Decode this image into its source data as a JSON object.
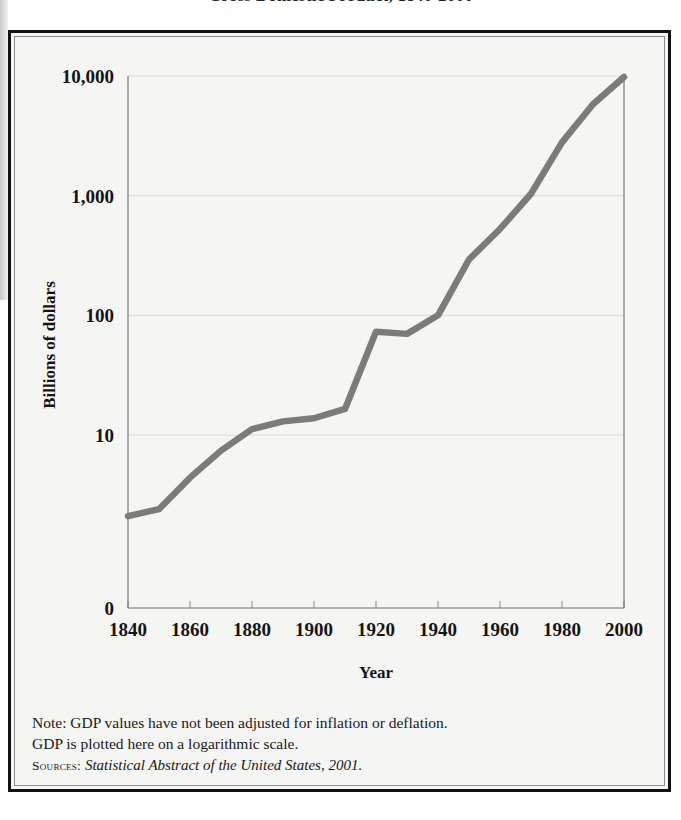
{
  "figure": {
    "title": "Gross Domestic Product, 1840-2000",
    "frame_background": "#f5f5f3",
    "frame_border_color": "#121212"
  },
  "footer": {
    "note_line_1": "Note: GDP values have not been adjusted for inflation or deflation.",
    "note_line_2": "GDP is plotted here on a logarithmic scale.",
    "sources_label": "Sources:",
    "sources_text": "Statistical Abstract of the United States, 2001."
  },
  "chart_data": {
    "type": "line",
    "title": "Gross Domestic Product, 1840-2000",
    "xlabel": "Year",
    "ylabel": "Billions of dollars",
    "yscale": "log",
    "grid": true,
    "legend": "none",
    "line_color": "#7b7b79",
    "ylim": [
      1.5,
      10000
    ],
    "xlim": [
      1840,
      2000
    ],
    "ytick_labels": [
      "10,000",
      "1,000",
      "100",
      "10",
      "0"
    ],
    "ytick_values": [
      10000,
      1000,
      100,
      10,
      1.5
    ],
    "xtick_labels": [
      "1840",
      "1860",
      "1880",
      "1900",
      "1920",
      "1940",
      "1960",
      "1980",
      "2000"
    ],
    "xtick_values": [
      1840,
      1860,
      1880,
      1900,
      1920,
      1940,
      1960,
      1980,
      2000
    ],
    "x": [
      1840,
      1850,
      1860,
      1870,
      1880,
      1890,
      1900,
      1910,
      1920,
      1930,
      1940,
      1950,
      1960,
      1970,
      1980,
      1990,
      2000
    ],
    "values": [
      2.1,
      2.4,
      4.4,
      7.4,
      11.2,
      13.0,
      13.8,
      16.5,
      73.0,
      70.0,
      100.0,
      293.0,
      527.0,
      1038.0,
      2790.0,
      5803.0,
      9800.0
    ],
    "series": [
      {
        "name": "Gross Domestic Product",
        "values": [
          2.1,
          2.4,
          4.4,
          7.4,
          11.2,
          13.0,
          13.8,
          16.5,
          73.0,
          70.0,
          100.0,
          293.0,
          527.0,
          1038.0,
          2790.0,
          5803.0,
          9800.0
        ]
      }
    ]
  }
}
